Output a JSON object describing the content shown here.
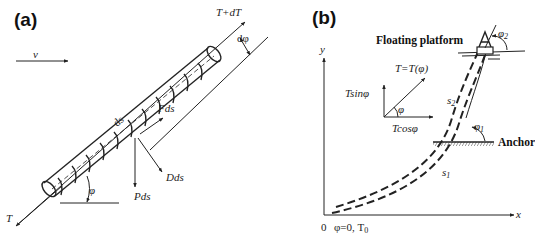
{
  "figure": {
    "panel_a": {
      "label": "(a)",
      "velocity_label": "v",
      "tension_top": "T+dT",
      "tension_bottom": "T",
      "angle_increment": "dφ",
      "angle": "φ",
      "element_length": "ds",
      "friction_force": "Fds",
      "drag_force": "Dds",
      "weight_force": "Pds"
    },
    "panel_b": {
      "label": "(b)",
      "y_axis": "y",
      "x_axis": "x",
      "origin": "0",
      "origin_condition": "φ=0, T",
      "origin_condition_sub": "0",
      "tension_function": "T=T(φ)",
      "vertical_component": "Tsinφ",
      "horizontal_component": "Tcosφ",
      "component_angle": "φ",
      "floating_platform": "Floating platform",
      "anchor": "Anchor",
      "angle_top": "φ",
      "angle_top_sub": "2",
      "angle_mid": "φ",
      "angle_mid_sub": "1",
      "segment_upper": "s",
      "segment_upper_sub": "2",
      "segment_lower": "s",
      "segment_lower_sub": "1"
    }
  }
}
